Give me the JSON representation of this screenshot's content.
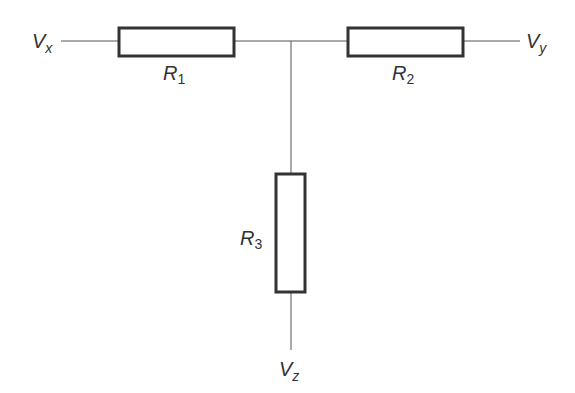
{
  "diagram": {
    "type": "resistor-tee-network",
    "colors": {
      "stroke": "#3a3a3a",
      "wire": "#555555",
      "background": "#ffffff"
    },
    "nodes": [
      {
        "id": "Vx",
        "label": "V",
        "sub": "x"
      },
      {
        "id": "Vy",
        "label": "V",
        "sub": "y"
      },
      {
        "id": "Vz",
        "label": "V",
        "sub": "z"
      }
    ],
    "resistors": [
      {
        "id": "R1",
        "label": "R",
        "sub": "1"
      },
      {
        "id": "R2",
        "label": "R",
        "sub": "2"
      },
      {
        "id": "R3",
        "label": "R",
        "sub": "3"
      }
    ],
    "connections": [
      [
        "Vx",
        "R1"
      ],
      [
        "R1",
        "junction"
      ],
      [
        "junction",
        "R2"
      ],
      [
        "R2",
        "Vy"
      ],
      [
        "junction",
        "R3"
      ],
      [
        "R3",
        "Vz"
      ]
    ]
  }
}
